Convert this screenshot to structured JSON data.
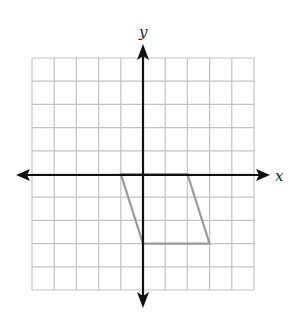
{
  "figure": {
    "type": "coordinate-plane",
    "x_axis_label": "x",
    "y_axis_label": "y",
    "grid": {
      "x_min": -5,
      "x_max": 5,
      "y_min": -5,
      "y_max": 5,
      "step": 1
    },
    "colors": {
      "grid": "#c4c4c4",
      "axes": "#111111",
      "shape": "#9a9a9a",
      "background": "#ffffff"
    },
    "shape": {
      "name": "parallelogram",
      "vertices": [
        [
          -1,
          0
        ],
        [
          2,
          0
        ],
        [
          3,
          -3
        ],
        [
          0,
          -3
        ]
      ]
    }
  }
}
